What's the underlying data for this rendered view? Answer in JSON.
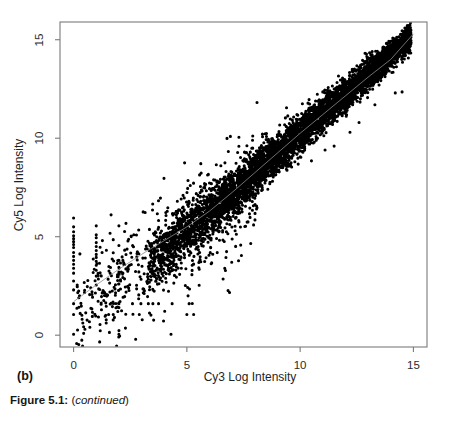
{
  "figure": {
    "panel_label": "(b)",
    "caption_prefix": "Figure 5.1",
    "caption_separator": ":",
    "caption_paren_open": "(",
    "caption_emphasis": "continued",
    "caption_paren_close": ")"
  },
  "axes": {
    "x_title": "Cy3 Log Intensity",
    "y_title": "Cy5 Log Intensity",
    "x_ticks": [
      "0",
      "5",
      "10",
      "15"
    ],
    "y_ticks": [
      "0",
      "5",
      "10",
      "15"
    ]
  },
  "colors": {
    "point": "#000000",
    "regression_line": "#8c8c8c",
    "axis": "#7a7a7a",
    "background": "#ffffff",
    "text": "#1a1a1a"
  },
  "chart_data": {
    "type": "scatter",
    "title": "",
    "xlabel": "Cy3 Log Intensity",
    "ylabel": "Cy5 Log Intensity",
    "xlim": [
      -0.6,
      15.6
    ],
    "ylim": [
      -0.6,
      15.9
    ],
    "xticks": [
      0,
      5,
      10,
      15
    ],
    "yticks": [
      0,
      5,
      10,
      15
    ],
    "grid": false,
    "legend": null,
    "marker": "filled-circle",
    "marker_size_px": 3.1,
    "n_points_approx": 6800,
    "annotations": [
      {
        "text": "(b)",
        "position": "below-left-of-axes"
      },
      {
        "text": "Figure 5.1: (continued)",
        "position": "figure-caption"
      }
    ],
    "regression_line": {
      "type": "lowess-fit",
      "color": "#8c8c8c",
      "width_px": 0.8,
      "points": [
        [
          0.0,
          1.7
        ],
        [
          1.0,
          2.55
        ],
        [
          2.0,
          3.35
        ],
        [
          3.0,
          4.1
        ],
        [
          4.0,
          4.8
        ],
        [
          5.0,
          5.5
        ],
        [
          6.0,
          6.3
        ],
        [
          7.0,
          7.25
        ],
        [
          8.0,
          8.25
        ],
        [
          9.0,
          9.25
        ],
        [
          10.0,
          10.25
        ],
        [
          11.0,
          11.2
        ],
        [
          12.0,
          12.15
        ],
        [
          13.0,
          13.1
        ],
        [
          14.0,
          14.0
        ],
        [
          15.0,
          15.3
        ]
      ]
    },
    "series": [
      {
        "name": "main-diagonal-cloud",
        "description": "Dense near-linear band of array spots, Cy5 tracks Cy3 with tight spread that narrows at high intensity",
        "color": "#000000",
        "model": {
          "kind": "band",
          "x_range": [
            3.2,
            14.9
          ],
          "slope": 1.0,
          "intercept": 0.22,
          "spread_at_low_x": 0.72,
          "spread_at_high_x": 0.3,
          "density_weight": 0.88,
          "count": 5400
        }
      },
      {
        "name": "low-intensity-scatter",
        "description": "Diffuse low-signal spots below and left of the band, much larger variance",
        "color": "#000000",
        "model": {
          "kind": "cloud",
          "x_range": [
            0.0,
            8.2
          ],
          "slope": 0.82,
          "intercept": 1.05,
          "spread": 1.45,
          "count": 620
        }
      },
      {
        "name": "saturated-quantized-column-x0",
        "description": "Vertical column of spots at Cy3 = 0 (floored/undetected green channel)",
        "color": "#000000",
        "x": [
          0.0,
          0.0,
          0.0,
          0.0,
          0.0,
          0.0,
          0.0,
          0.0,
          0.0,
          0.0,
          0.0,
          0.0,
          0.0,
          0.0,
          0.0,
          0.0,
          0.0,
          0.0,
          0.0
        ],
        "y": [
          0.05,
          1.05,
          1.6,
          2.3,
          2.75,
          3.15,
          3.4,
          3.6,
          3.8,
          4.0,
          4.2,
          4.45,
          4.6,
          4.75,
          4.9,
          5.05,
          5.25,
          5.5,
          5.95
        ]
      },
      {
        "name": "quantized-column-x1",
        "description": "Vertical column of spots at Cy3 = 1",
        "color": "#000000",
        "x": [
          1.0,
          1.0,
          1.0,
          1.0,
          1.0,
          1.0,
          1.0,
          1.0,
          1.0,
          1.0,
          1.0,
          1.0,
          1.0
        ],
        "y": [
          2.55,
          3.0,
          3.3,
          3.55,
          3.75,
          3.95,
          4.1,
          4.3,
          4.5,
          4.7,
          4.95,
          5.1,
          5.55
        ]
      },
      {
        "name": "quantized-column-x2",
        "description": "Vertical column of spots at Cy3 = 2",
        "color": "#000000",
        "x": [
          2.0,
          2.0,
          2.0,
          2.0,
          2.0,
          2.0,
          2.0,
          2.0,
          2.0
        ],
        "y": [
          0.05,
          1.4,
          1.65,
          2.6,
          3.2,
          3.45,
          3.8,
          4.55,
          5.55
        ]
      },
      {
        "name": "floor-row-y0",
        "description": "Spots resting on the Cy5 = 0 floor",
        "color": "#000000",
        "x": [
          0.0,
          2.0,
          4.3
        ],
        "y": [
          0.05,
          0.05,
          0.05
        ]
      },
      {
        "name": "floor-row-y1",
        "description": "Spots resting near Cy5 = 1.05",
        "color": "#000000",
        "x": [
          0.0,
          1.75,
          2.9,
          5.0,
          5.3
        ],
        "y": [
          1.05,
          1.05,
          1.05,
          1.05,
          1.05
        ]
      },
      {
        "name": "floor-row-y15",
        "description": "Spots resting near Cy5 = 1.6",
        "color": "#000000",
        "x": [
          0.0,
          2.0,
          2.6,
          3.3,
          3.5,
          3.75,
          4.35,
          5.1
        ],
        "y": [
          1.6,
          1.6,
          1.6,
          1.6,
          1.6,
          1.6,
          1.6,
          1.6
        ]
      },
      {
        "name": "high-outliers-above-band",
        "description": "Bright-red-channel outliers sitting above the main diagonal",
        "color": "#000000",
        "x": [
          4.9,
          5.05,
          5.15,
          5.6,
          6.3,
          6.5,
          7.8,
          8.6,
          9.4,
          10.1,
          11.0,
          12.3,
          12.6
        ],
        "y": [
          8.75,
          7.85,
          7.6,
          7.55,
          8.65,
          8.6,
          9.3,
          9.95,
          11.55,
          11.75,
          12.35,
          13.5,
          13.6
        ]
      },
      {
        "name": "high-outliers-below-band",
        "description": "Bright-green-channel outliers sitting below the main diagonal",
        "color": "#000000",
        "x": [
          6.6,
          7.3,
          7.7,
          8.0,
          8.3,
          9.6,
          10.5,
          11.1,
          11.5,
          12.2,
          12.6,
          13.3,
          14.2,
          14.5
        ],
        "y": [
          2.85,
          5.75,
          5.75,
          6.95,
          7.35,
          8.75,
          8.85,
          9.4,
          9.6,
          10.3,
          10.8,
          11.7,
          12.3,
          12.35
        ]
      }
    ]
  }
}
